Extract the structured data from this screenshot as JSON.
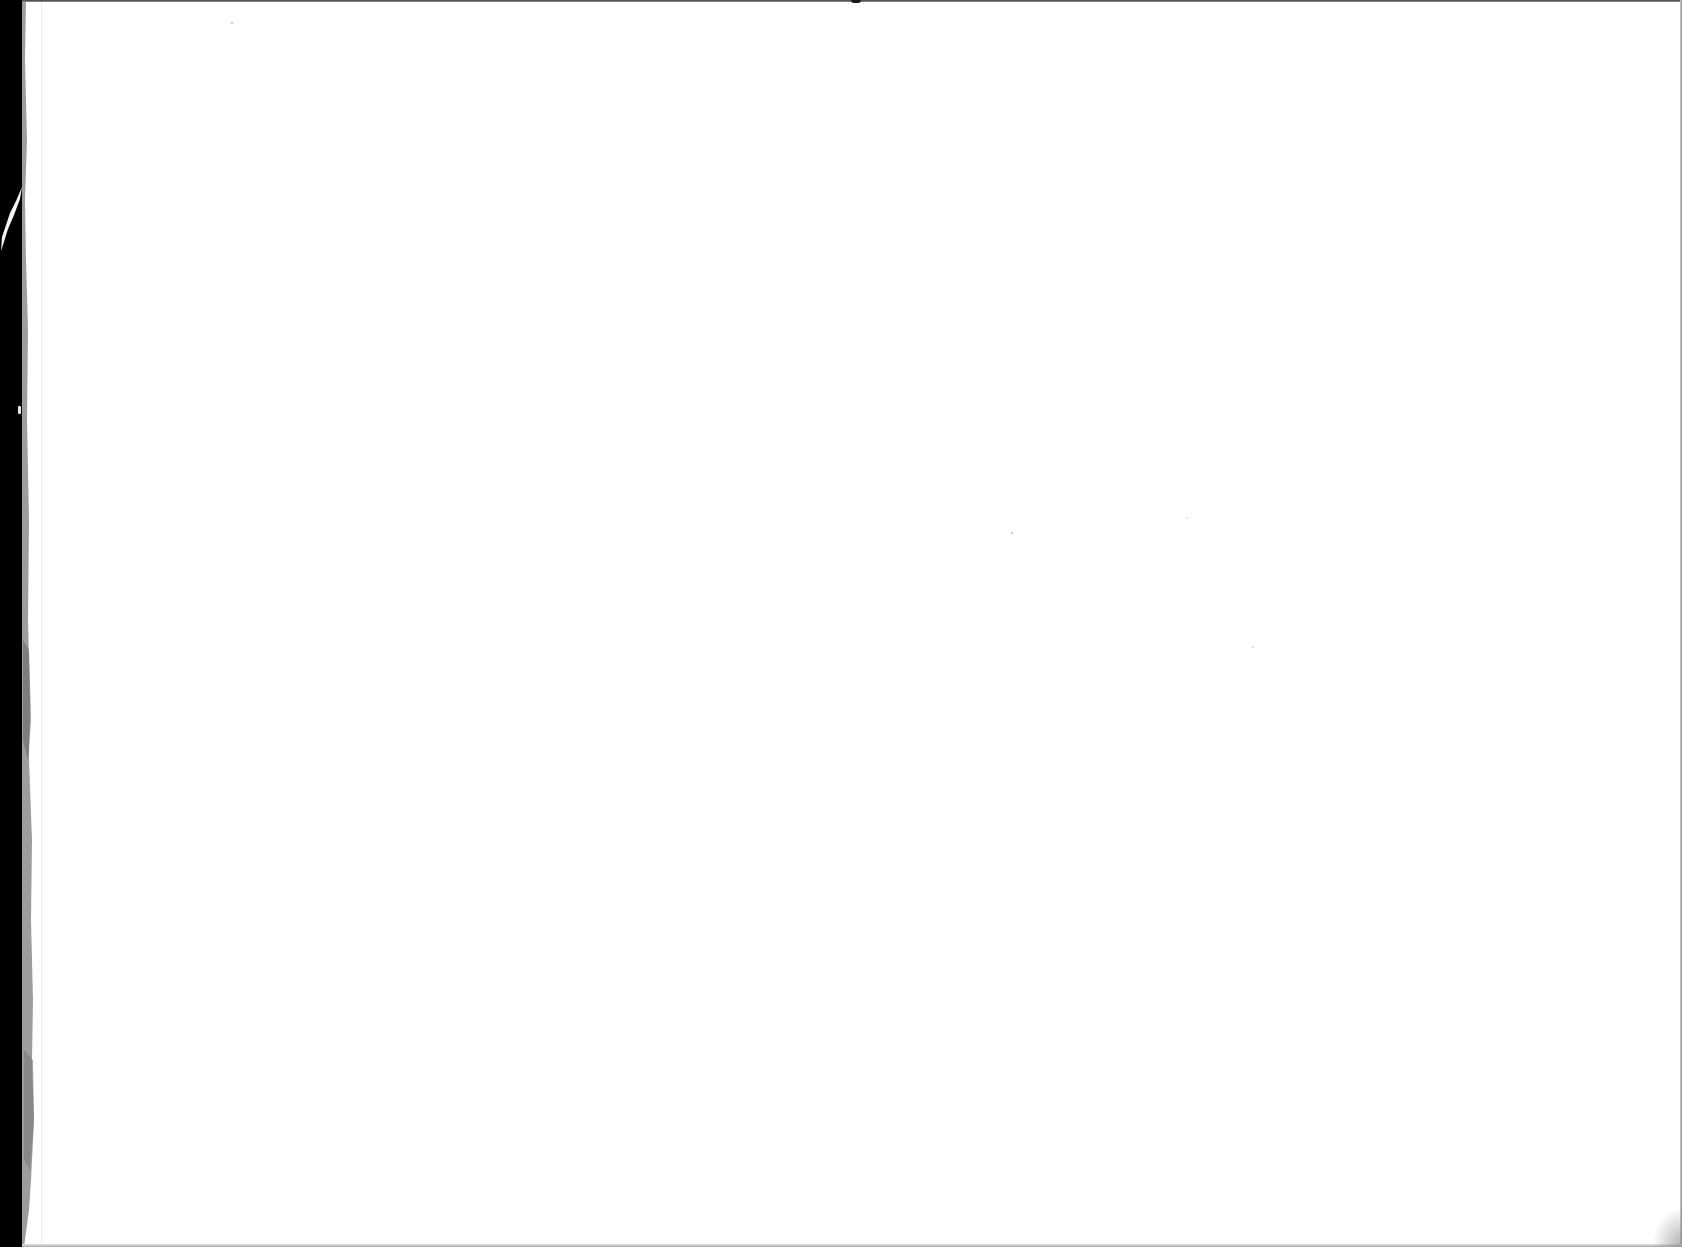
{
  "page": {
    "type": "blank-scanned-page",
    "text_content": [],
    "background_color": "#ffffff"
  },
  "artifacts": {
    "scanner_bed_color": "#000000",
    "paper_edge_color": "#8c8c8c",
    "top_border_color": "#3a3a3a",
    "right_border_color": "#8a8a8a",
    "bottom_border_color": "#a8a8a8",
    "specks": [
      {
        "x": 231,
        "y": 22
      },
      {
        "x": 1012,
        "y": 533
      },
      {
        "x": 1186,
        "y": 517
      },
      {
        "x": 1252,
        "y": 646
      }
    ]
  }
}
